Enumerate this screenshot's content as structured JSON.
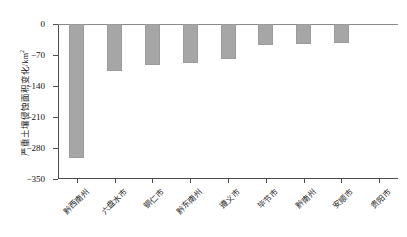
{
  "chart_data": {
    "type": "bar",
    "title": "",
    "xlabel": "",
    "ylabel": "严重土壤侵蚀面积变化/km²",
    "ylabel_text": "严重土壤侵蚀面积变化/km",
    "ylabel_sup": "2",
    "categories": [
      "黔西南州",
      "六盘水市",
      "铜仁市",
      "黔东南州",
      "遵义市",
      "毕节市",
      "黔南州",
      "安顺市",
      "贵阳市"
    ],
    "values": [
      -302,
      -105,
      -92,
      -87,
      -78,
      -48,
      -45,
      -42,
      0
    ],
    "ylim": [
      -350,
      0
    ],
    "yticks": [
      0,
      -70,
      -140,
      -210,
      -280,
      -350
    ],
    "ytick_labels": [
      "0",
      "−70",
      "−140",
      "−210",
      "−280",
      "−350"
    ],
    "grid": false,
    "legend": null,
    "bar_color": "#a6a6a6",
    "axis_color": "#4d4d4d",
    "text_color": "#1a1a1a"
  }
}
